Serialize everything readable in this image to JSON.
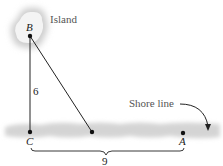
{
  "labels": {
    "island": "Island",
    "shore_line": "Shore line",
    "point_b": "B",
    "point_c": "C",
    "point_a": "A",
    "side_bc": "6",
    "side_ca": "9"
  },
  "colors": {
    "line": "#222222",
    "shore": "#d0d0d0",
    "island": "#cfcfcf"
  }
}
